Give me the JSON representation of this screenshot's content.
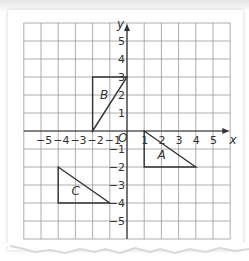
{
  "diagram": {
    "type": "coordinate_grid",
    "x_axis": {
      "label": "x",
      "min": -6,
      "max": 6,
      "ticks": [
        "-5",
        "-4",
        "-3",
        "-2",
        "-1",
        "1",
        "2",
        "3",
        "4",
        "5"
      ]
    },
    "y_axis": {
      "label": "y",
      "min": -6,
      "max": 6,
      "ticks": [
        "5",
        "4",
        "3",
        "2",
        "1",
        "-1",
        "-2",
        "-3",
        "-4",
        "-5"
      ]
    },
    "origin_label": "O",
    "shapes": [
      {
        "label": "A",
        "vertices": [
          [
            1,
            0
          ],
          [
            1,
            -2
          ],
          [
            4,
            -2
          ]
        ]
      },
      {
        "label": "B",
        "vertices": [
          [
            -2,
            0
          ],
          [
            -2,
            3
          ],
          [
            0,
            3
          ]
        ]
      },
      {
        "label": "C",
        "vertices": [
          [
            -4,
            -2
          ],
          [
            -4,
            -4
          ],
          [
            -1,
            -4
          ]
        ]
      }
    ],
    "colors": {
      "grid": "#999999",
      "axes": "#333333",
      "shape_stroke": "#333333",
      "text": "#333333"
    }
  }
}
